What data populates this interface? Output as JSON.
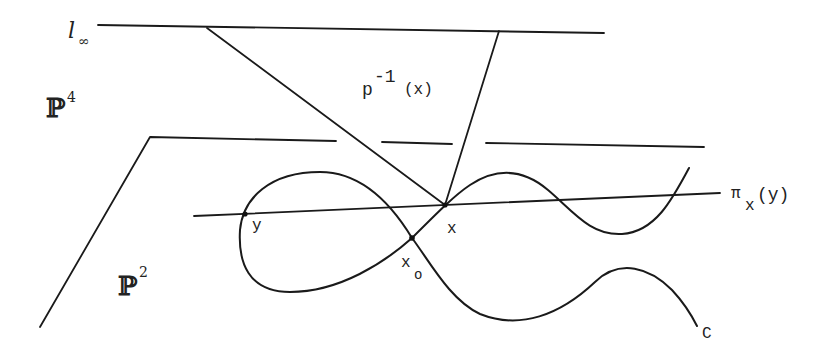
{
  "diagram": {
    "labels": {
      "line_at_infinity": "l",
      "line_at_infinity_sub": "∞",
      "ambient_space": "ℙ",
      "ambient_space_sup": "4",
      "plane": "ℙ",
      "plane_sup": "2",
      "fiber": "p",
      "fiber_sup": "-1",
      "fiber_arg": "(x)",
      "projection": "π",
      "projection_sub": "x",
      "projection_arg": "(y)",
      "point_x": "x",
      "point_y": "y",
      "point_x0": "x",
      "point_x0_sub": "o",
      "curve": "C"
    },
    "colors": {
      "stroke": "#1a1a1a",
      "background": "#ffffff"
    }
  }
}
